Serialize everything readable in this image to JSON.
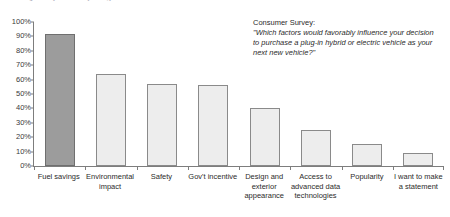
{
  "clipped_title": "Quality in everything we do",
  "annotation": {
    "title": "Consumer Survey:",
    "quote": "\"Which factors would favorably influence your decision to purchase a plug-in hybrid or electric vehicle as your next new vehicle?\""
  },
  "colors": {
    "highlight_bar": "#9c9c9c",
    "bar_fill": "#ededed",
    "bar_border": "#8a8a8a",
    "axis": "#7d7d7d",
    "text": "#2b2b2b"
  },
  "chart_data": {
    "type": "bar",
    "title": "",
    "xlabel": "",
    "ylabel": "",
    "ylim": [
      0,
      100
    ],
    "grid": false,
    "legend": "none",
    "categories": [
      "Fuel savings",
      "Environmental impact",
      "Safety",
      "Gov't incentive",
      "Design and exterior appearance",
      "Access to advanced data technologies",
      "Popularity",
      "I want to make a statement"
    ],
    "values": [
      92,
      64,
      57,
      56,
      40,
      25,
      15,
      9
    ],
    "highlight_index": 0,
    "ytick_labels": [
      "100%",
      "90%",
      "80%",
      "70%",
      "60%",
      "50%",
      "40%",
      "30%",
      "20%",
      "10%",
      "0%"
    ],
    "ytick_values": [
      100,
      90,
      80,
      70,
      60,
      50,
      40,
      30,
      20,
      10,
      0
    ]
  }
}
